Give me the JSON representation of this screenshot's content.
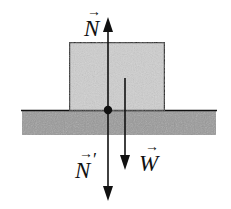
{
  "diagram": {
    "type": "free-body-diagram",
    "colors": {
      "block_fill": "#cfcfcf",
      "ground_fill": "#9a9a9a",
      "line": "#111111",
      "background": "#ffffff"
    },
    "objects": {
      "block": {
        "label": ""
      },
      "ground": {
        "label": ""
      },
      "contact_point": {
        "label": ""
      }
    },
    "vectors": [
      {
        "id": "normal-force",
        "symbol": "N",
        "prime": "",
        "direction": "up"
      },
      {
        "id": "reaction-force",
        "symbol": "N",
        "prime": "′",
        "direction": "down"
      },
      {
        "id": "weight",
        "symbol": "W",
        "prime": "",
        "direction": "down"
      }
    ],
    "arrow_glyph": "→"
  }
}
